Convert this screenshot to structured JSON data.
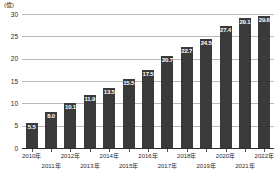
{
  "chart_data": {
    "type": "bar",
    "title": "",
    "subtitle": "",
    "unit_label": "(億)",
    "xlabel": "",
    "ylabel": "",
    "ylim": [
      0,
      30
    ],
    "yticks": [
      0,
      5,
      10,
      15,
      20,
      25,
      30
    ],
    "ytick_labels": [
      "0",
      "5",
      "10",
      "15",
      "20",
      "25",
      "30"
    ],
    "grid": true,
    "legend": "none",
    "bar_color": "#3a3a3a",
    "value_label_color": "#ffffff",
    "gridline_color": "#b9b9b9",
    "axis_color": "#2b2b2b",
    "categories": [
      "2010年",
      "2011年",
      "2012年",
      "2013年",
      "2014年",
      "2015年",
      "2016年",
      "2017年",
      "2018年",
      "2019年",
      "2020年",
      "2021年",
      "2022年"
    ],
    "values": [
      5.5,
      8.0,
      10.1,
      11.9,
      13.5,
      15.5,
      17.5,
      20.7,
      22.7,
      24.5,
      27.4,
      29.1,
      29.6
    ],
    "value_labels": [
      "5.5",
      "8.0",
      "10.1",
      "11.9",
      "13.5",
      "15.5",
      "17.5",
      "20.7",
      "22.7",
      "24.5",
      "27.4",
      "29.1",
      "29.6"
    ]
  }
}
